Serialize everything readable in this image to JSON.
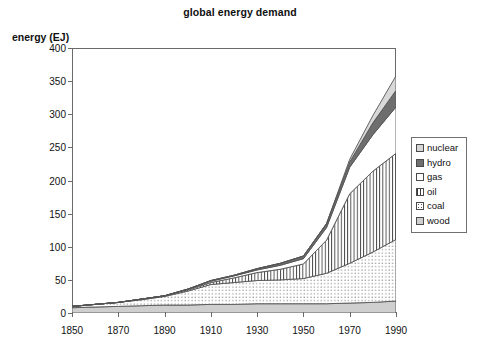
{
  "chart_data": {
    "type": "area",
    "title": "global energy demand",
    "xlabel": "",
    "ylabel": "energy (EJ)",
    "stacked": true,
    "grid": false,
    "legend_position": "right",
    "xlim": [
      1850,
      1990
    ],
    "ylim": [
      0,
      400
    ],
    "xticks": [
      1850,
      1870,
      1890,
      1910,
      1930,
      1950,
      1970,
      1990
    ],
    "yticks": [
      0,
      50,
      100,
      150,
      200,
      250,
      300,
      350,
      400
    ],
    "x": [
      1850,
      1860,
      1870,
      1880,
      1890,
      1900,
      1910,
      1920,
      1930,
      1940,
      1950,
      1960,
      1970,
      1980,
      1990
    ],
    "stack_order_bottom_to_top": [
      "wood",
      "coal",
      "oil",
      "gas",
      "hydro",
      "nuclear"
    ],
    "series": [
      {
        "name": "wood",
        "color": "#cfcfcf",
        "pattern": "solid-light-gray",
        "values": [
          8,
          9,
          10,
          11,
          12,
          12,
          13,
          13,
          14,
          14,
          14,
          14,
          15,
          16,
          18
        ]
      },
      {
        "name": "coal",
        "color": "#ffffff",
        "pattern": "dotted",
        "values": [
          2,
          4,
          6,
          9,
          13,
          21,
          30,
          33,
          35,
          36,
          38,
          46,
          60,
          76,
          93
        ]
      },
      {
        "name": "oil",
        "color": "#ffffff",
        "pattern": "vertical-lines",
        "values": [
          0,
          0,
          0,
          1,
          1,
          2,
          3,
          7,
          12,
          16,
          22,
          50,
          105,
          122,
          130
        ]
      },
      {
        "name": "gas",
        "color": "#ffffff",
        "pattern": "plain-white",
        "values": [
          0,
          0,
          0,
          0,
          0,
          1,
          2,
          3,
          4,
          6,
          8,
          19,
          40,
          55,
          70
        ]
      },
      {
        "name": "hydro",
        "color": "#6e6e6e",
        "pattern": "solid-dark-gray",
        "values": [
          0,
          0,
          0,
          0,
          0,
          0,
          1,
          1,
          2,
          3,
          4,
          6,
          8,
          18,
          25
        ]
      },
      {
        "name": "nuclear",
        "color": "#d6d6d6",
        "pattern": "solid-light-gray",
        "values": [
          0,
          0,
          0,
          0,
          0,
          0,
          0,
          0,
          0,
          0,
          0,
          0,
          4,
          11,
          22
        ]
      }
    ],
    "totals": [
      10,
      13,
      16,
      21,
      26,
      36,
      49,
      57,
      67,
      75,
      86,
      135,
      232,
      298,
      358
    ],
    "annotations": []
  },
  "legend": {
    "items": [
      {
        "label": "nuclear",
        "swatch": "sw-nuclear"
      },
      {
        "label": "hydro",
        "swatch": "sw-hydro"
      },
      {
        "label": "gas",
        "swatch": "sw-gas"
      },
      {
        "label": "oil",
        "swatch": "sw-oil"
      },
      {
        "label": "coal",
        "swatch": "sw-coal"
      },
      {
        "label": "wood",
        "swatch": "sw-wood"
      }
    ]
  }
}
